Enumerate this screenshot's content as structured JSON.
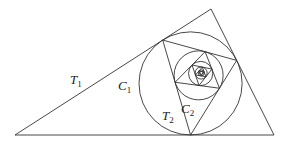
{
  "figure": {
    "outer_triangle": {
      "A": [
        15,
        135
      ],
      "B": [
        274,
        135
      ],
      "C": [
        211,
        9
      ]
    },
    "iterations": 6,
    "stroke_color": "#333333",
    "labels": [
      {
        "id": "T1",
        "base": "T",
        "sub": "1",
        "x": 70,
        "y": 73
      },
      {
        "id": "C1",
        "base": "C",
        "sub": "1",
        "x": 118,
        "y": 79
      },
      {
        "id": "T2",
        "base": "T",
        "sub": "2",
        "x": 162,
        "y": 109
      },
      {
        "id": "C2",
        "base": "C",
        "sub": "2",
        "x": 181,
        "y": 102
      }
    ]
  }
}
